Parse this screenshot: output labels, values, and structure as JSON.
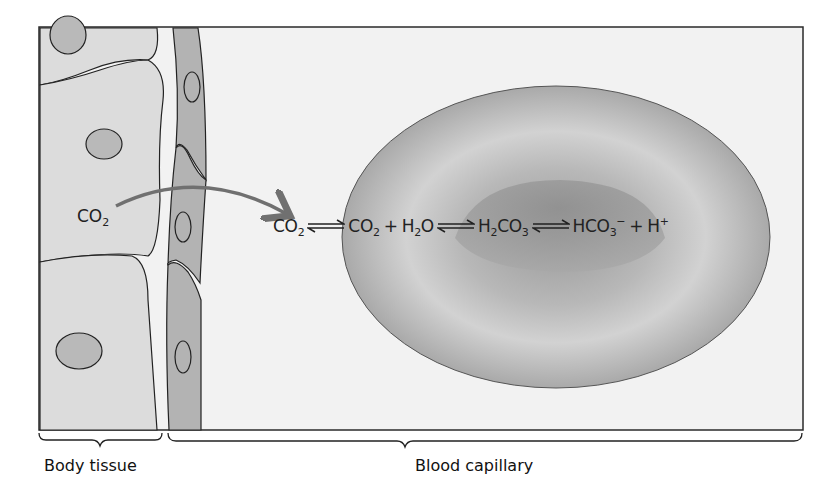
{
  "figure": {
    "colors": {
      "frame": "#2a2a2a",
      "background": "#f2f2f2",
      "tissue_cell": "#dcdcdc",
      "nucleus": "#b9b9b9",
      "capillary_wall": "#b3b3b3",
      "rbc_outer": "#c4c4c4",
      "rbc_inner": "#999999",
      "arrow": "#707070"
    }
  },
  "tissue": {
    "co2_label": {
      "base": "CO",
      "sub": "2"
    }
  },
  "equation": {
    "terms": [
      {
        "base": "CO",
        "sub": "2"
      },
      {
        "base": "CO",
        "sub": "2"
      },
      {
        "pre": "H",
        "sub": "2",
        "post": "O"
      },
      {
        "pre": "H",
        "sub": "2",
        "post": "CO",
        "sub2": "3"
      },
      {
        "pre": "HCO",
        "sub": "3",
        "sup": "−"
      },
      {
        "pre": "H",
        "sup": "+"
      }
    ],
    "plus": "+",
    "arrow_icon": "equilibrium-arrows"
  },
  "labels": {
    "body_tissue": "Body tissue",
    "blood_capillary": "Blood capillary"
  }
}
